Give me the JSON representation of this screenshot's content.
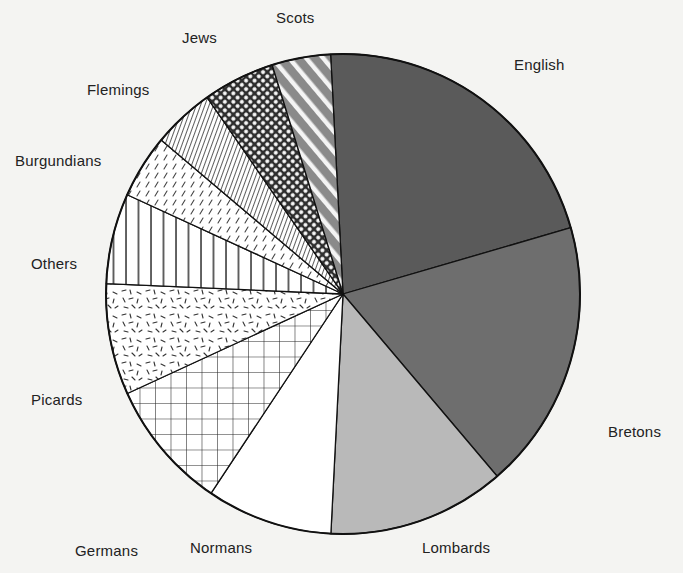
{
  "chart_data": {
    "type": "pie",
    "title": "",
    "start_angle_deg": -3,
    "direction": "clockwise",
    "slices": [
      {
        "label": "English",
        "value": 21.4,
        "pattern": "solid",
        "fill": "#5a5a5a",
        "label_x": 514,
        "label_y": 70
      },
      {
        "label": "Bretons",
        "value": 18.2,
        "pattern": "solid",
        "fill": "#6e6e6e",
        "label_x": 608,
        "label_y": 437
      },
      {
        "label": "Lombards",
        "value": 12.1,
        "pattern": "solid",
        "fill": "#b9b9b9",
        "label_x": 422,
        "label_y": 553
      },
      {
        "label": "Normans",
        "value": 8.6,
        "pattern": "solid",
        "fill": "#ffffff",
        "label_x": 190,
        "label_y": 553
      },
      {
        "label": "Germans",
        "value": 8.8,
        "pattern": "grid",
        "fill": "#ffffff",
        "label_x": 75,
        "label_y": 556
      },
      {
        "label": "Picards",
        "value": 7.5,
        "pattern": "random-dashes",
        "fill": "#ffffff",
        "label_x": 31,
        "label_y": 405
      },
      {
        "label": "Others",
        "value": 6.1,
        "pattern": "vertical-lines",
        "fill": "#ffffff",
        "label_x": 31,
        "label_y": 269
      },
      {
        "label": "Burgundians",
        "value": 4.3,
        "pattern": "diagonal-dashes",
        "fill": "#ffffff",
        "label_x": 15,
        "label_y": 166
      },
      {
        "label": "Flemings",
        "value": 4.2,
        "pattern": "fine-diagonal",
        "fill": "#bdbdbd",
        "label_x": 87,
        "label_y": 95
      },
      {
        "label": "Jews",
        "value": 4.9,
        "pattern": "crosshatch-dots",
        "fill": "#d8d8d8",
        "label_x": 182,
        "label_y": 43
      },
      {
        "label": "Scots",
        "value": 4.0,
        "pattern": "wide-diagonal",
        "fill": "#8a8a8a",
        "label_x": 276,
        "label_y": 23
      }
    ],
    "legend": "none (labels placed outside slices)",
    "center": [
      343,
      294
    ],
    "radius_x": 237,
    "radius_y": 240
  }
}
